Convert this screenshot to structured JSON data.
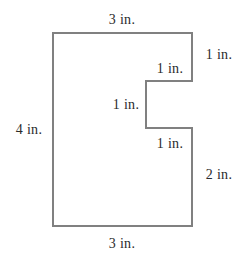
{
  "figure": {
    "unit": "in.",
    "stroke_color": "#808080",
    "fill_color": "#ffffff",
    "text_color": "#2b2b2b",
    "stroke_width": 2
  },
  "shape": {
    "name": "notched-rectangle",
    "outline_points": "53,33 192,33 192,81 146,81 146,128 192,128 192,226 53,226",
    "bounding_box": {
      "left": 53,
      "top": 33,
      "right": 192,
      "bottom": 226
    }
  },
  "labels": {
    "top": {
      "text": "3 in.",
      "x": 122,
      "y": 20
    },
    "left": {
      "text": "4 in.",
      "x": 29,
      "y": 130
    },
    "bottom": {
      "text": "3 in.",
      "x": 122,
      "y": 244
    },
    "right_top": {
      "text": "1 in.",
      "x": 219,
      "y": 55
    },
    "right_bottom": {
      "text": "2 in.",
      "x": 219,
      "y": 175
    },
    "notch_top": {
      "text": "1 in.",
      "x": 170,
      "y": 69
    },
    "notch_left": {
      "text": "1 in.",
      "x": 126,
      "y": 105
    },
    "notch_bottom": {
      "text": "1 in.",
      "x": 170,
      "y": 144
    }
  }
}
